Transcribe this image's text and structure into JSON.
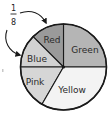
{
  "fraction_label": {
    "numerator": "1",
    "denominator": "8"
  },
  "pie": {
    "center": [
      63.5,
      67
    ],
    "radius": 43,
    "stroke": "#1a1a1a",
    "slices": [
      {
        "label": "Green",
        "fraction": "1/4",
        "start_deg": 0,
        "end_deg": 90,
        "fill": "#b5b5b5",
        "label_pos": [
          85,
          50
        ]
      },
      {
        "label": "Red",
        "fraction": "1/8",
        "start_deg": 90,
        "end_deg": 135,
        "fill": "#9a9a9a",
        "label_pos": [
          52,
          40
        ]
      },
      {
        "label": "Blue",
        "fraction": "1/8",
        "start_deg": 135,
        "end_deg": 180,
        "fill": "#d2d2d2",
        "label_pos": [
          37,
          59
        ]
      },
      {
        "label": "Pink",
        "fraction": "1/6",
        "start_deg": 180,
        "end_deg": 240,
        "fill": "#d6d6d6",
        "label_pos": [
          35,
          82
        ]
      },
      {
        "label": "Yellow",
        "fraction": "1/3",
        "start_deg": 240,
        "end_deg": 360,
        "fill": "#f3f3f3",
        "label_pos": [
          72,
          90
        ]
      }
    ]
  },
  "chart_data": {
    "type": "pie",
    "title": "",
    "categories": [
      "Green",
      "Red",
      "Blue",
      "Pink",
      "Yellow"
    ],
    "values": [
      0.25,
      0.125,
      0.125,
      0.1667,
      0.3333
    ],
    "fractions": [
      "1/4",
      "1/8",
      "1/8",
      "1/6",
      "1/3"
    ],
    "annotations": [
      {
        "text": "1/8",
        "points_to": [
          "Red",
          "Blue"
        ]
      }
    ],
    "legend": "none (labels inside slices)"
  }
}
